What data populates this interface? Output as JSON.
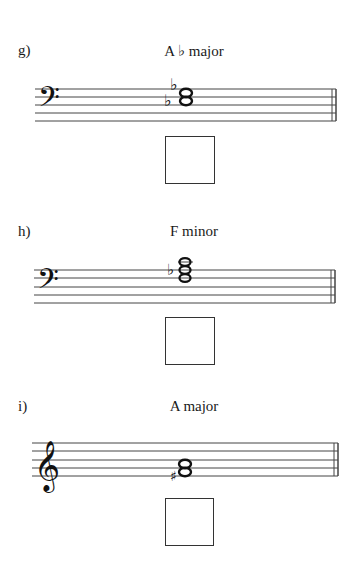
{
  "exercises": [
    {
      "letter": "g)",
      "title": "A ♭  major",
      "clef": "bass",
      "chord": {
        "root": "Ab",
        "accidentals": [
          "flat",
          "flat"
        ]
      }
    },
    {
      "letter": "h)",
      "title": "F minor",
      "clef": "bass",
      "chord": {
        "root": "F",
        "accidentals": [
          "flat"
        ]
      }
    },
    {
      "letter": "i)",
      "title": "A major",
      "clef": "treble",
      "chord": {
        "root": "A",
        "accidentals": [
          "sharp"
        ]
      }
    }
  ]
}
